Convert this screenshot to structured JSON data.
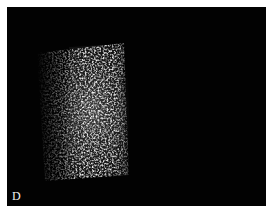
{
  "figure": {
    "panel_label": "D",
    "background_color": "#020202",
    "specimen_color": "#e8e8e8"
  }
}
